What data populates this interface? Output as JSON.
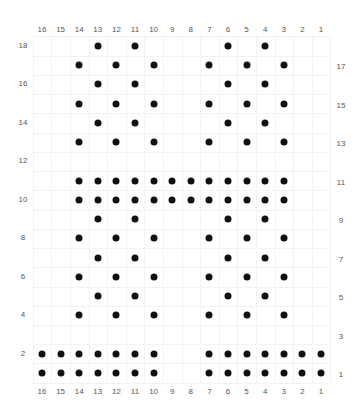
{
  "chart": {
    "type": "stitch-chart",
    "columns": 16,
    "rows": 18,
    "top_column_labels": [
      "16",
      "15",
      "14",
      "13",
      "12",
      "11",
      "10",
      "9",
      "8",
      "7",
      "6",
      "5",
      "4",
      "3",
      "2",
      "1"
    ],
    "bottom_column_labels": [
      "16",
      "15",
      "14",
      "13",
      "12",
      "11",
      "10",
      "9",
      "8",
      "7",
      "6",
      "5",
      "4",
      "3",
      "2",
      "1"
    ],
    "left_row_labels": [
      "18",
      "16",
      "14",
      "12",
      "10",
      "8",
      "6",
      "4",
      "2"
    ],
    "right_row_labels": [
      "17",
      "15",
      "13",
      "11",
      "9",
      "7",
      "5",
      "3",
      "1"
    ],
    "dot_color": "#111111",
    "grid_color": "#f3f3f3",
    "label_color": "#555555",
    "dots_by_row": {
      "18": [
        13,
        11,
        6,
        4
      ],
      "17": [
        14,
        12,
        10,
        7,
        5,
        3
      ],
      "16": [
        13,
        11,
        6,
        4
      ],
      "15": [
        14,
        12,
        10,
        7,
        5,
        3
      ],
      "14": [
        13,
        11,
        6,
        4
      ],
      "13": [
        14,
        12,
        10,
        7,
        5,
        3
      ],
      "12": [],
      "11": [
        14,
        13,
        12,
        11,
        10,
        9,
        8,
        7,
        6,
        5,
        4,
        3
      ],
      "10": [
        14,
        13,
        12,
        11,
        10,
        9,
        8,
        7,
        6,
        5,
        4,
        3
      ],
      "9": [
        13,
        11,
        6,
        4
      ],
      "8": [
        14,
        12,
        10,
        7,
        5,
        3
      ],
      "7": [
        13,
        11,
        6,
        4
      ],
      "6": [
        14,
        12,
        10,
        7,
        5,
        3
      ],
      "5": [
        13,
        11,
        6,
        4
      ],
      "4": [
        14,
        12,
        10,
        7,
        5,
        3
      ],
      "3": [],
      "2": [
        16,
        15,
        14,
        13,
        12,
        11,
        10,
        7,
        6,
        5,
        4,
        3,
        2,
        1
      ],
      "1": [
        16,
        15,
        14,
        13,
        12,
        11,
        10,
        7,
        6,
        5,
        4,
        3,
        2,
        1
      ]
    }
  }
}
